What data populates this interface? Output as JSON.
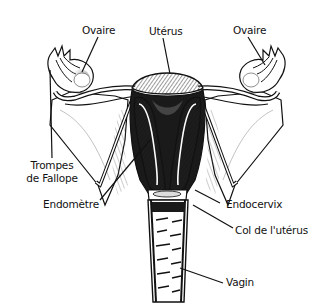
{
  "diagram": {
    "title": "",
    "style": "black-and-white anatomical line illustration",
    "colors": {
      "ink": "#111111",
      "background": "#ffffff",
      "shade": "#555555"
    },
    "labels": {
      "ovary_left": "Ovaire",
      "uterus": "Utérus",
      "ovary_right": "Ovaire",
      "fallopian_tubes_line1": "Trompes",
      "fallopian_tubes_line2": "de Fallope",
      "endometrium": "Endomètre",
      "endocervix": "Endocervix",
      "cervix": "Col de l'utérus",
      "vagina": "Vagin"
    }
  }
}
